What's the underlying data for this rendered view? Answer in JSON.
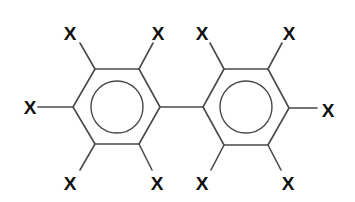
{
  "diagram": {
    "type": "chemical-structure",
    "molecule": "biphenyl",
    "substituent_label": "X",
    "colors": {
      "bond": "#4a4a4a",
      "label": "#111111",
      "background": "#ffffff"
    },
    "rings": [
      {
        "name": "left-ring",
        "vertices": [
          [
            95,
            69
          ],
          [
            139,
            69
          ],
          [
            160,
            107
          ],
          [
            139,
            144
          ],
          [
            95,
            144
          ],
          [
            73,
            107
          ]
        ],
        "aromatic_circle": {
          "cx": 117,
          "cy": 107,
          "r": 26
        },
        "substituents": [
          {
            "position": "top-left",
            "label": "X",
            "bond": [
              [
                95,
                69
              ],
              [
                80,
                43
              ]
            ],
            "label_pos": [
              70,
              40
            ]
          },
          {
            "position": "top-right",
            "label": "X",
            "bond": [
              [
                139,
                69
              ],
              [
                153,
                43
              ]
            ],
            "label_pos": [
              158,
              40
            ]
          },
          {
            "position": "left",
            "label": "X",
            "bond": [
              [
                73,
                107
              ],
              [
                38,
                107
              ]
            ],
            "label_pos": [
              30,
              114
            ]
          },
          {
            "position": "bottom-left",
            "label": "X",
            "bond": [
              [
                95,
                144
              ],
              [
                80,
                170
              ]
            ],
            "label_pos": [
              70,
              190
            ]
          },
          {
            "position": "bottom-right",
            "label": "X",
            "bond": [
              [
                139,
                144
              ],
              [
                152,
                170
              ]
            ],
            "label_pos": [
              157,
              190
            ]
          }
        ]
      },
      {
        "name": "right-ring",
        "vertices": [
          [
            224,
            69
          ],
          [
            268,
            69
          ],
          [
            289,
            108
          ],
          [
            268,
            145
          ],
          [
            224,
            145
          ],
          [
            203,
            107
          ]
        ],
        "aromatic_circle": {
          "cx": 246,
          "cy": 107,
          "r": 26
        },
        "substituents": [
          {
            "position": "top-left",
            "label": "X",
            "bond": [
              [
                224,
                69
              ],
              [
                210,
                43
              ]
            ],
            "label_pos": [
              202,
              40
            ]
          },
          {
            "position": "top-right",
            "label": "X",
            "bond": [
              [
                268,
                69
              ],
              [
                282,
                43
              ]
            ],
            "label_pos": [
              289,
              40
            ]
          },
          {
            "position": "right",
            "label": "X",
            "bond": [
              [
                289,
                108
              ],
              [
                317,
                108
              ]
            ],
            "label_pos": [
              328,
              117
            ]
          },
          {
            "position": "bottom-left",
            "label": "X",
            "bond": [
              [
                224,
                145
              ],
              [
                211,
                170
              ]
            ],
            "label_pos": [
              202,
              190
            ]
          },
          {
            "position": "bottom-right",
            "label": "X",
            "bond": [
              [
                268,
                145
              ],
              [
                281,
                170
              ]
            ],
            "label_pos": [
              288,
              190
            ]
          }
        ]
      }
    ],
    "bridge_bond": [
      [
        160,
        107
      ],
      [
        203,
        107
      ]
    ]
  }
}
